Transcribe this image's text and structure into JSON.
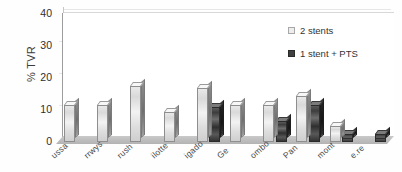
{
  "chart_data": {
    "type": "bar",
    "title": "",
    "subtitle": "",
    "xlabel": "",
    "ylabel": "% TVR",
    "ylim": [
      0,
      40
    ],
    "yticks": [
      0,
      10,
      20,
      30,
      40
    ],
    "grid": true,
    "legend_position": "top-right",
    "three_d": true,
    "note": "x-axis category labels are rotated and cropped by the image edge; only trailing fragments are legible",
    "categories": [
      "ussa",
      "rrwys",
      "rush",
      "ilotte",
      "igado",
      "Ge",
      "ombo",
      "Pan",
      "mont",
      "e.re"
    ],
    "series": [
      {
        "name": "2 stents",
        "color": "#ededed",
        "values": [
          11.5,
          11.5,
          17.5,
          9.5,
          17.0,
          11.5,
          11.5,
          14.5,
          5.0,
          0
        ]
      },
      {
        "name": "1 stent + PTS",
        "color": "#3f3f3f",
        "values": [
          0,
          0,
          0,
          0,
          11.0,
          0,
          6.5,
          11.5,
          2.5,
          2.5
        ]
      }
    ]
  },
  "legend": {
    "items": [
      {
        "label": "2 stents",
        "swatch": "light"
      },
      {
        "label": "1 stent + PTS",
        "swatch": "dark"
      }
    ]
  },
  "axes": {
    "y_title": "% TVR",
    "y_ticks": [
      "40",
      "30",
      "20",
      "10",
      "0"
    ]
  }
}
